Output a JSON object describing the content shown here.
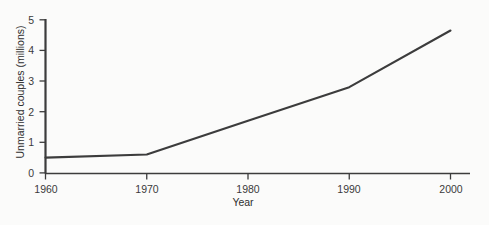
{
  "chart_data": {
    "type": "line",
    "title": "",
    "xlabel": "Year",
    "ylabel": "Unmarried couples (millions)",
    "x": [
      1960,
      1970,
      1980,
      1990,
      2000
    ],
    "values": [
      0.5,
      0.6,
      1.7,
      2.8,
      4.65
    ],
    "series": [
      {
        "name": "Unmarried couples",
        "values": [
          0.5,
          0.6,
          1.7,
          2.8,
          4.65
        ]
      }
    ],
    "xlim": [
      1960,
      2000
    ],
    "ylim": [
      0,
      5
    ],
    "x_ticks": [
      1960,
      1970,
      1980,
      1990,
      2000
    ],
    "y_ticks": [
      0,
      1,
      2,
      3,
      4,
      5
    ],
    "x_tick_labels": [
      "1960",
      "1970",
      "1980",
      "1990",
      "2000"
    ],
    "y_tick_labels": [
      "0",
      "1",
      "2",
      "3",
      "4",
      "5"
    ],
    "grid": false,
    "legend": false,
    "line_color": "#3c3c3c",
    "axis_color": "#3c3c3c",
    "background_color": "#fbfbfa"
  },
  "axes": {
    "y_title": "Unmarried couples (millions)",
    "x_title": "Year",
    "y_ticks": [
      {
        "label": "5"
      },
      {
        "label": "4"
      },
      {
        "label": "3"
      },
      {
        "label": "2"
      },
      {
        "label": "1"
      },
      {
        "label": "0"
      }
    ],
    "x_ticks": [
      {
        "label": "1960"
      },
      {
        "label": "1970"
      },
      {
        "label": "1980"
      },
      {
        "label": "1990"
      },
      {
        "label": "2000"
      }
    ]
  }
}
